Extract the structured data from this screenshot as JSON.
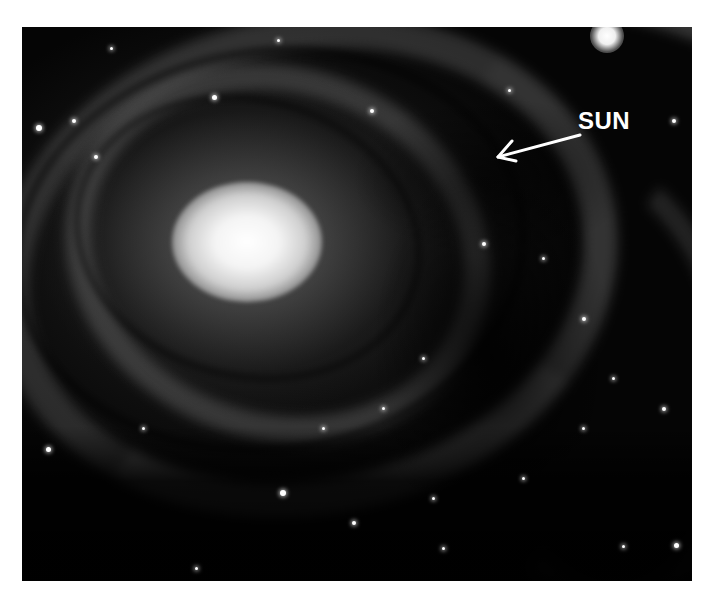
{
  "figure": {
    "annotation": {
      "label": "SUN",
      "arrow": "arrow pointing down-left to the Sun's location in an outer spiral arm",
      "label_color": "#ffffff"
    },
    "colors": {
      "background": "#ffffff",
      "sky": "#050505",
      "core": "#ffffff"
    }
  }
}
